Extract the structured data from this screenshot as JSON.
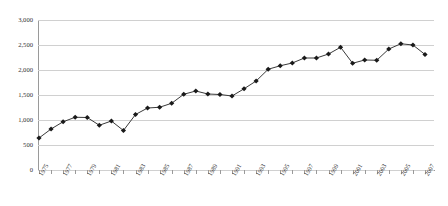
{
  "chart_data": {
    "type": "line",
    "title": "",
    "xlabel": "",
    "ylabel": "",
    "ylim": [
      0,
      3000
    ],
    "ytick_values": [
      0,
      500,
      1000,
      1500,
      2000,
      2500,
      3000
    ],
    "ytick_labels": [
      "0",
      "500",
      "1,000",
      "1,500",
      "2,000",
      "2,500",
      "3,000"
    ],
    "grid": true,
    "legend": "none",
    "marker": "diamond",
    "line_color": "#3a3a3a",
    "marker_color": "#1a1a1a",
    "grid_color": "#d0d0d0",
    "axis_color": "#9a9a9a",
    "x": [
      1975,
      1976,
      1977,
      1978,
      1979,
      1980,
      1981,
      1982,
      1983,
      1984,
      1985,
      1986,
      1987,
      1988,
      1989,
      1990,
      1991,
      1992,
      1993,
      1994,
      1995,
      1996,
      1997,
      1998,
      1999,
      2000,
      2001,
      2002,
      2003,
      2004,
      2005,
      2006,
      2007
    ],
    "categories": [
      "1975",
      "1976",
      "1977",
      "1978",
      "1979",
      "1980",
      "1981",
      "1982",
      "1983",
      "1984",
      "1985",
      "1986",
      "1987",
      "1988",
      "1989",
      "1990",
      "1991",
      "1992",
      "1993",
      "1994",
      "1995",
      "1996",
      "1997",
      "1998",
      "1999",
      "2000",
      "2001",
      "2002",
      "2003",
      "2004",
      "2005",
      "2006",
      "2007"
    ],
    "xtick_labels_shown": [
      "1975",
      "1977",
      "1979",
      "1981",
      "1983",
      "1985",
      "1987",
      "1989",
      "1991",
      "1993",
      "1995",
      "1997",
      "1999",
      "2001",
      "2003",
      "2005",
      "2007"
    ],
    "values": [
      640,
      820,
      965,
      1055,
      1050,
      895,
      980,
      790,
      1110,
      1240,
      1255,
      1335,
      1515,
      1580,
      1520,
      1510,
      1480,
      1625,
      1780,
      2015,
      2085,
      2140,
      2240,
      2240,
      2320,
      2455,
      2135,
      2200,
      2195,
      2420,
      2525,
      2500,
      2310
    ]
  }
}
